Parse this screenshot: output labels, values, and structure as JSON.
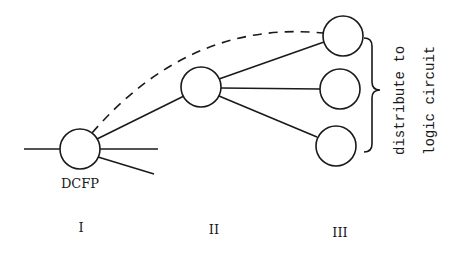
{
  "diagram": {
    "nodes": [
      {
        "id": "dcfp",
        "label": "DCFP",
        "cx": 80,
        "cy": 149,
        "r": 20,
        "stage": "I"
      },
      {
        "id": "stage2",
        "label": "",
        "cx": 201,
        "cy": 87,
        "r": 20,
        "stage": "II"
      },
      {
        "id": "stage3a",
        "label": "",
        "cx": 343,
        "cy": 36,
        "r": 20,
        "stage": "III"
      },
      {
        "id": "stage3b",
        "label": "",
        "cx": 340,
        "cy": 89,
        "r": 20,
        "stage": "III"
      },
      {
        "id": "stage3c",
        "label": "",
        "cx": 336,
        "cy": 146,
        "r": 20,
        "stage": "III"
      }
    ],
    "dcfp_label": "DCFP",
    "stage_labels": [
      "I",
      "II",
      "III"
    ],
    "annotation": {
      "line1": "distribute to",
      "line2": "logic circuit"
    },
    "stroke_color": "#1a1a1a",
    "background": "#ffffff"
  }
}
